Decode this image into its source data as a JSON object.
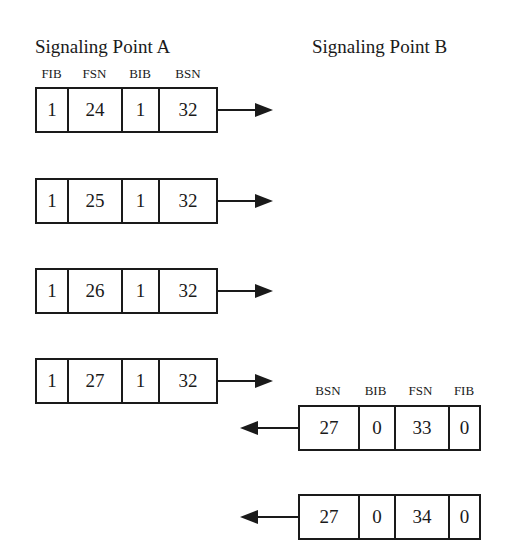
{
  "titles": {
    "point_a": "Signaling Point A",
    "point_b": "Signaling Point B"
  },
  "headers_a": [
    "FIB",
    "FSN",
    "BIB",
    "BSN"
  ],
  "headers_b": [
    "BSN",
    "BIB",
    "FSN",
    "FIB"
  ],
  "frames_a": [
    {
      "fib": "1",
      "fsn": "24",
      "bib": "1",
      "bsn": "32"
    },
    {
      "fib": "1",
      "fsn": "25",
      "bib": "1",
      "bsn": "32"
    },
    {
      "fib": "1",
      "fsn": "26",
      "bib": "1",
      "bsn": "32"
    },
    {
      "fib": "1",
      "fsn": "27",
      "bib": "1",
      "bsn": "32"
    }
  ],
  "frames_b": [
    {
      "bsn": "27",
      "bib": "0",
      "fsn": "33",
      "fib": "0"
    },
    {
      "bsn": "27",
      "bib": "0",
      "fsn": "34",
      "fib": "0"
    }
  ],
  "colors": {
    "line": "#1a1a1a",
    "background": "#ffffff"
  }
}
